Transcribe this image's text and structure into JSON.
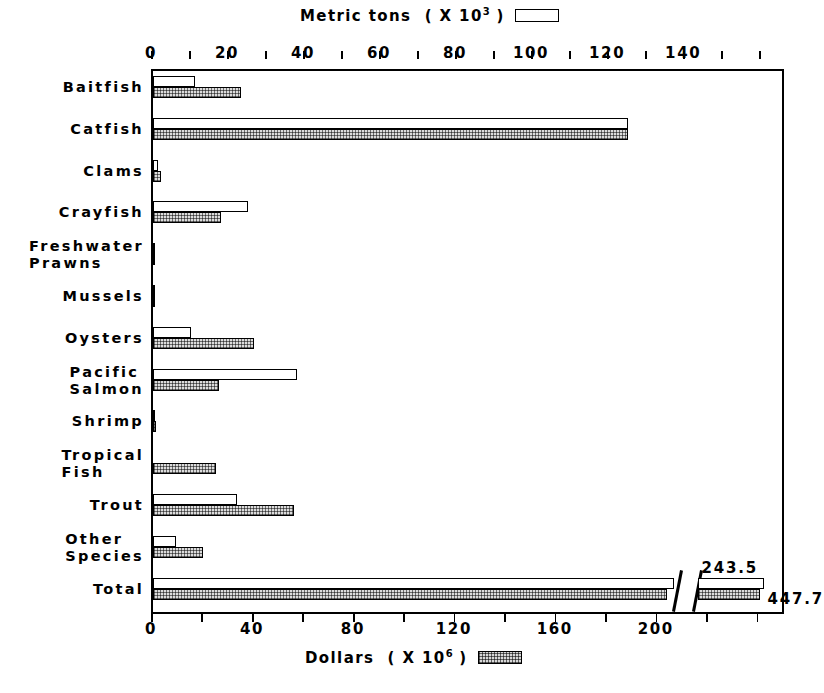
{
  "legend": {
    "top": {
      "label": "Metric tons  ( X 10",
      "exponent": "3",
      "suffix": " )",
      "swatch": "open-rectangle-swatch"
    },
    "bottom": {
      "label": "Dollars  ( X 10",
      "exponent": "6",
      "suffix": " )",
      "swatch": "stippled-rectangle-swatch"
    }
  },
  "chart_data": {
    "type": "bar",
    "orientation": "horizontal",
    "title": "",
    "categories": [
      "Baitfish",
      "Catfish",
      "Clams",
      "Crayfish",
      "Freshwater\nPrawns",
      "Mussels",
      "Oysters",
      "Pacific\nSalmon",
      "Shrimp",
      "Tropical\nFish",
      "Trout",
      "Other\nSpecies",
      "Total"
    ],
    "series": [
      {
        "name": "Metric tons ( X 10^3 )",
        "axis": "top",
        "unit": "metric tons (x1000)",
        "values": [
          11,
          125,
          1.2,
          25,
          0.4,
          0.4,
          10,
          38,
          0.6,
          0,
          22,
          6,
          243.5
        ]
      },
      {
        "name": "Dollars ( X 10^6 )",
        "axis": "bottom",
        "unit": "dollars (x1,000,000)",
        "values": [
          35,
          188,
          3,
          27,
          0.8,
          0.8,
          40,
          26,
          1.3,
          25,
          56,
          20,
          447.7
        ]
      }
    ],
    "xaxis_top": {
      "label": "Metric tons ( X 10^3 )",
      "min": 0,
      "max": 166,
      "ticks": [
        0,
        20,
        40,
        60,
        80,
        100,
        120,
        140
      ],
      "minor_tick_step": 10
    },
    "xaxis_bottom": {
      "label": "Dollars ( X 10^6 )",
      "min": 0,
      "max": 250,
      "ticks": [
        0,
        40,
        80,
        120,
        160,
        200
      ],
      "minor_tick_step": 20
    },
    "grid": false,
    "axis_break": {
      "present": true,
      "note": "axis break before Total bar ends"
    },
    "annotations": [
      {
        "text": "243.5",
        "series": "Metric tons ( X 10^3 )",
        "category": "Total"
      },
      {
        "text": "447.7",
        "series": "Dollars ( X 10^6 )",
        "category": "Total"
      }
    ]
  },
  "ticklabels_top": [
    "0",
    "20",
    "40",
    "60",
    "80",
    "100",
    "120",
    "140"
  ],
  "ticklabels_bottom": [
    "0",
    "40",
    "80",
    "120",
    "160",
    "200"
  ],
  "total_labels": {
    "tons": "243.5",
    "dollars": "447.7"
  },
  "colors": {
    "ink": "#000000",
    "background": "#ffffff",
    "stipple": "#dcdcdc"
  }
}
